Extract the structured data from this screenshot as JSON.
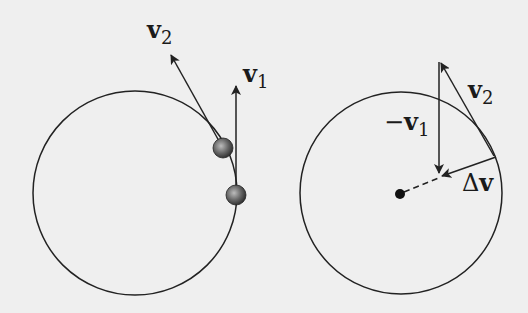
{
  "left_panel": {
    "label_v2": {
      "main": "v",
      "sub": "2"
    },
    "label_v1": {
      "main": "v",
      "sub": "1"
    }
  },
  "right_panel": {
    "label_neg_v1": {
      "prefix": "−",
      "main": "v",
      "sub": "1"
    },
    "label_v2": {
      "main": "v",
      "sub": "2"
    },
    "label_dv": {
      "delta": "Δ",
      "main": "v"
    }
  },
  "colors": {
    "background": "#efefef",
    "stroke": "#222222"
  }
}
